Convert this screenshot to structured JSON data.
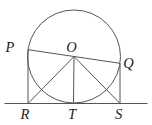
{
  "diagram": {
    "colors": {
      "background": "#ffffff",
      "stroke": "#555555",
      "label": "#1c1c1c"
    },
    "stroke_width": 1,
    "circle": {
      "cx": 74,
      "cy": 56.5,
      "r": 46.5
    },
    "tangent_line": {
      "x1": 4.5,
      "y1": 103.5,
      "x2": 147.5,
      "y2": 103.5
    },
    "points": {
      "P": {
        "x": 28,
        "y": 49.7,
        "label": "P",
        "label_x": 10,
        "label_y": 52
      },
      "O": {
        "x": 74,
        "y": 56.5,
        "label": "O",
        "label_x": 71.5,
        "label_y": 51.5
      },
      "Q": {
        "x": 120,
        "y": 63.3,
        "label": "Q",
        "label_x": 128.5,
        "label_y": 67.5
      },
      "R": {
        "x": 28,
        "y": 103.5,
        "label": "R",
        "label_x": 25,
        "label_y": 119
      },
      "T": {
        "x": 73.5,
        "y": 103.5,
        "label": "T",
        "label_x": 72,
        "label_y": 119
      },
      "S": {
        "x": 120,
        "y": 103.5,
        "label": "S",
        "label_x": 118.5,
        "label_y": 118.5
      }
    },
    "segments": [
      {
        "from": "P",
        "to": "Q",
        "name": "diameter-PQ"
      },
      {
        "from": "P",
        "to": "R",
        "name": "segment-PR"
      },
      {
        "from": "Q",
        "to": "S",
        "name": "segment-QS"
      },
      {
        "from": "O",
        "to": "R",
        "name": "segment-OR"
      },
      {
        "from": "O",
        "to": "T",
        "name": "segment-OT"
      },
      {
        "from": "O",
        "to": "S",
        "name": "segment-OS"
      }
    ]
  }
}
